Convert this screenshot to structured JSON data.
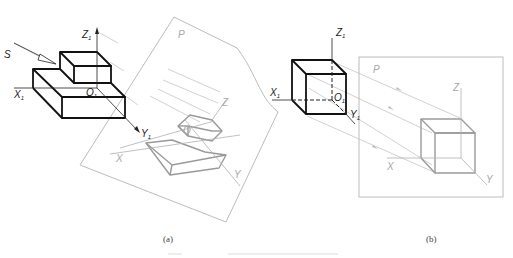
{
  "figure": {
    "panel_a": {
      "caption": "(a)",
      "labels": {
        "projection_direction": "S",
        "axis_z1": "Z",
        "axis_z1_sub": "1",
        "axis_x1": "X",
        "axis_x1_sub": "1",
        "axis_y1": "Y",
        "axis_y1_sub": "1",
        "origin_o1": "O",
        "origin_o1_sub": "1",
        "plane": "P",
        "proj_z": "Z",
        "proj_x": "X",
        "proj_y": "Y",
        "proj_o": "O"
      }
    },
    "panel_b": {
      "caption": "(b)",
      "labels": {
        "axis_z1": "Z",
        "axis_z1_sub": "1",
        "axis_x1": "X",
        "axis_x1_sub": "1",
        "axis_y1": "Y",
        "axis_y1_sub": "1",
        "origin_o1": "O",
        "origin_o1_sub": "1",
        "plane": "P",
        "proj_z": "Z",
        "proj_x": "X",
        "proj_y": "Y"
      }
    },
    "colors": {
      "object_lines": "#111111",
      "projection_lines": "#9a9a9a",
      "plane_lines": "#bcbcbc"
    }
  }
}
